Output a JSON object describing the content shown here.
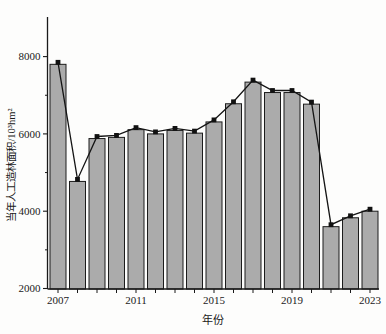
{
  "chart_data": {
    "type": "bar",
    "title": "",
    "xlabel": "年份",
    "ylabel": "当年人工造林面积/10³hm²",
    "categories": [
      2007,
      2008,
      2009,
      2010,
      2011,
      2012,
      2013,
      2014,
      2015,
      2016,
      2017,
      2018,
      2019,
      2020,
      2021,
      2022,
      2023
    ],
    "values": [
      7800,
      4770,
      5880,
      5910,
      6110,
      6000,
      6090,
      6020,
      6310,
      6780,
      7340,
      7070,
      7070,
      6770,
      3600,
      3830,
      4000
    ],
    "overlay_line": {
      "type": "line",
      "marker": "square",
      "values": [
        7800,
        4770,
        5880,
        5910,
        6110,
        6000,
        6090,
        6020,
        6310,
        6780,
        7340,
        7070,
        7070,
        6770,
        3600,
        3830,
        4000
      ]
    },
    "ylim": [
      2000,
      9000
    ],
    "y_major_ticks": [
      2000,
      4000,
      6000,
      8000
    ],
    "y_minor_ticks": [
      3000,
      5000,
      7000
    ],
    "x_labeled_ticks": [
      2007,
      2011,
      2015,
      2019,
      2023
    ],
    "grid": "off",
    "legend": "none"
  },
  "colors": {
    "bar_fill": "#ababab",
    "bar_edge": "#1c1c1c",
    "line": "#141414",
    "marker": "#111111",
    "axis": "#1a1a1a",
    "background": "#fdfdfc",
    "text": "#1a1a1a"
  }
}
